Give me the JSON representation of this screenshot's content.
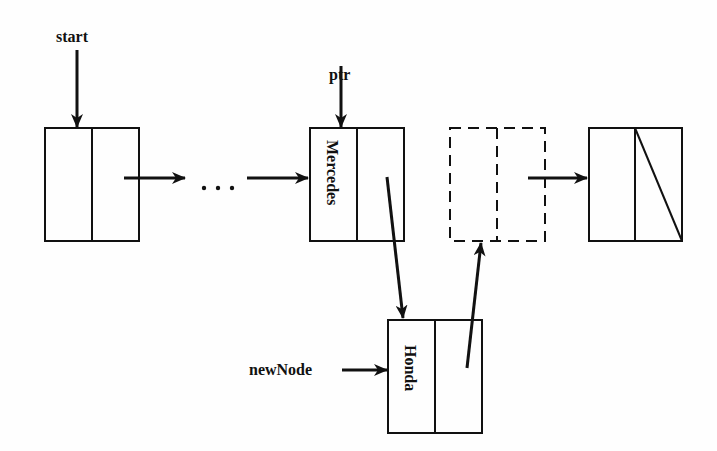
{
  "diagram": {
    "type": "linked-list-insertion",
    "pointers": {
      "start": "start",
      "ptr": "ptr",
      "new_node": "newNode"
    },
    "nodes": [
      {
        "id": "head",
        "data": "",
        "style": "solid"
      },
      {
        "id": "mercedes",
        "data": "Mercedes",
        "style": "solid"
      },
      {
        "id": "removed-next",
        "data": "",
        "style": "dashed"
      },
      {
        "id": "tail",
        "data": "",
        "style": "solid",
        "next": "null"
      },
      {
        "id": "honda",
        "data": "Honda",
        "style": "solid"
      }
    ],
    "ellipsis": "...",
    "colors": {
      "stroke": "#111111",
      "background": "#fefefe"
    }
  }
}
